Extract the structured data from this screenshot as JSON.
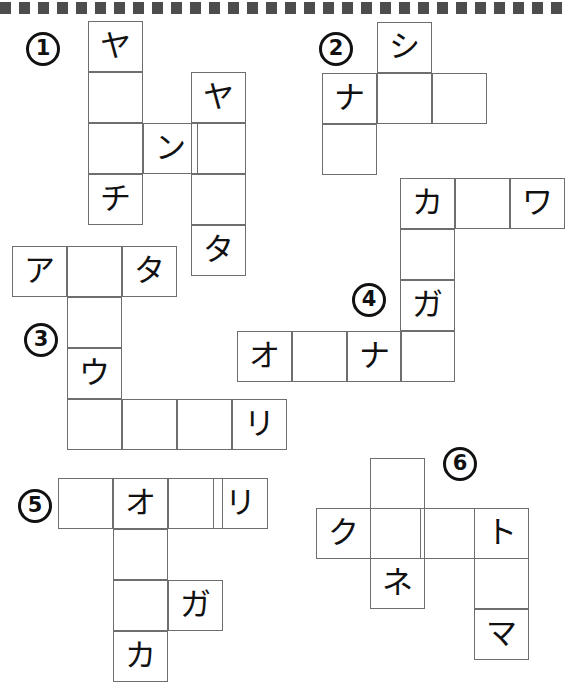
{
  "page": {
    "background_color": "#ffffff",
    "grid_line_color": "#6e6e6e",
    "text_color": "#111111",
    "top_border": {
      "name": "dotted-strip",
      "tick_count": 38,
      "color": "#4d4d4d"
    }
  },
  "puzzles": [
    {
      "number": "1",
      "number_label": "①",
      "label_pos": {
        "x": 26,
        "y": 32
      },
      "cells": [
        {
          "x": 88,
          "y": 21,
          "w": 55,
          "h": 51,
          "text": "ヤ"
        },
        {
          "x": 88,
          "y": 72,
          "w": 55,
          "h": 51,
          "text": ""
        },
        {
          "x": 88,
          "y": 123,
          "w": 55,
          "h": 51,
          "text": ""
        },
        {
          "x": 88,
          "y": 174,
          "w": 55,
          "h": 51,
          "text": "チ"
        },
        {
          "x": 143,
          "y": 123,
          "w": 55,
          "h": 51,
          "text": "ン"
        },
        {
          "x": 191,
          "y": 72,
          "w": 55,
          "h": 51,
          "text": "ヤ"
        },
        {
          "x": 191,
          "y": 123,
          "w": 55,
          "h": 51,
          "text": ""
        },
        {
          "x": 191,
          "y": 174,
          "w": 55,
          "h": 51,
          "text": ""
        },
        {
          "x": 191,
          "y": 225,
          "w": 55,
          "h": 51,
          "text": "タ"
        }
      ]
    },
    {
      "number": "2",
      "number_label": "②",
      "label_pos": {
        "x": 319,
        "y": 32
      },
      "cells": [
        {
          "x": 377,
          "y": 22,
          "w": 55,
          "h": 51,
          "text": "シ"
        },
        {
          "x": 322,
          "y": 73,
          "w": 55,
          "h": 51,
          "text": "ナ"
        },
        {
          "x": 377,
          "y": 73,
          "w": 55,
          "h": 51,
          "text": ""
        },
        {
          "x": 432,
          "y": 73,
          "w": 55,
          "h": 51,
          "text": ""
        },
        {
          "x": 322,
          "y": 124,
          "w": 55,
          "h": 51,
          "text": ""
        }
      ]
    },
    {
      "number": "3",
      "number_label": "③",
      "label_pos": {
        "x": 24,
        "y": 323
      },
      "cells": [
        {
          "x": 12,
          "y": 246,
          "w": 55,
          "h": 51,
          "text": "ア"
        },
        {
          "x": 67,
          "y": 246,
          "w": 55,
          "h": 51,
          "text": ""
        },
        {
          "x": 122,
          "y": 246,
          "w": 55,
          "h": 51,
          "text": "タ"
        },
        {
          "x": 67,
          "y": 297,
          "w": 55,
          "h": 51,
          "text": ""
        },
        {
          "x": 67,
          "y": 348,
          "w": 55,
          "h": 51,
          "text": "ウ"
        },
        {
          "x": 67,
          "y": 399,
          "w": 55,
          "h": 51,
          "text": ""
        },
        {
          "x": 122,
          "y": 399,
          "w": 55,
          "h": 51,
          "text": ""
        },
        {
          "x": 177,
          "y": 399,
          "w": 55,
          "h": 51,
          "text": ""
        },
        {
          "x": 232,
          "y": 399,
          "w": 55,
          "h": 51,
          "text": "リ"
        }
      ]
    },
    {
      "number": "4",
      "number_label": "④",
      "label_pos": {
        "x": 352,
        "y": 283
      },
      "cells": [
        {
          "x": 400,
          "y": 178,
          "w": 55,
          "h": 51,
          "text": "カ"
        },
        {
          "x": 455,
          "y": 178,
          "w": 55,
          "h": 51,
          "text": ""
        },
        {
          "x": 510,
          "y": 178,
          "w": 55,
          "h": 51,
          "text": "ワ"
        },
        {
          "x": 400,
          "y": 229,
          "w": 55,
          "h": 51,
          "text": ""
        },
        {
          "x": 400,
          "y": 280,
          "w": 55,
          "h": 51,
          "text": "ガ"
        },
        {
          "x": 237,
          "y": 331,
          "w": 55,
          "h": 51,
          "text": "オ"
        },
        {
          "x": 292,
          "y": 331,
          "w": 55,
          "h": 51,
          "text": ""
        },
        {
          "x": 347,
          "y": 331,
          "w": 55,
          "h": 51,
          "text": "ナ"
        },
        {
          "x": 400,
          "y": 331,
          "w": 55,
          "h": 51,
          "text": ""
        }
      ]
    },
    {
      "number": "5",
      "number_label": "⑤",
      "label_pos": {
        "x": 18,
        "y": 489
      },
      "cells": [
        {
          "x": 58,
          "y": 478,
          "w": 55,
          "h": 51,
          "text": ""
        },
        {
          "x": 113,
          "y": 478,
          "w": 55,
          "h": 51,
          "text": "オ"
        },
        {
          "x": 168,
          "y": 478,
          "w": 55,
          "h": 51,
          "text": ""
        },
        {
          "x": 213,
          "y": 478,
          "w": 55,
          "h": 51,
          "text": "リ"
        },
        {
          "x": 113,
          "y": 529,
          "w": 55,
          "h": 51,
          "text": ""
        },
        {
          "x": 113,
          "y": 580,
          "w": 55,
          "h": 51,
          "text": ""
        },
        {
          "x": 168,
          "y": 580,
          "w": 55,
          "h": 51,
          "text": "ガ"
        },
        {
          "x": 113,
          "y": 631,
          "w": 55,
          "h": 51,
          "text": "カ"
        }
      ]
    },
    {
      "number": "6",
      "number_label": "⑥",
      "label_pos": {
        "x": 443,
        "y": 447
      },
      "cells": [
        {
          "x": 370,
          "y": 458,
          "w": 55,
          "h": 51,
          "text": ""
        },
        {
          "x": 316,
          "y": 508,
          "w": 55,
          "h": 51,
          "text": "ク"
        },
        {
          "x": 370,
          "y": 508,
          "w": 55,
          "h": 51,
          "text": ""
        },
        {
          "x": 420,
          "y": 508,
          "w": 55,
          "h": 51,
          "text": ""
        },
        {
          "x": 474,
          "y": 508,
          "w": 55,
          "h": 51,
          "text": "ト"
        },
        {
          "x": 370,
          "y": 558,
          "w": 55,
          "h": 51,
          "text": "ネ"
        },
        {
          "x": 474,
          "y": 558,
          "w": 55,
          "h": 51,
          "text": ""
        },
        {
          "x": 474,
          "y": 609,
          "w": 55,
          "h": 51,
          "text": "マ"
        }
      ]
    }
  ]
}
